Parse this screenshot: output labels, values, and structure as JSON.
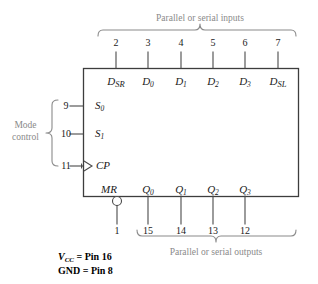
{
  "diagram": {
    "chip": {
      "x": 83,
      "y": 68,
      "width": 215,
      "height": 128,
      "stroke": "#3d3d3d"
    },
    "colors": {
      "line": "#4a4a4a",
      "text": "#1a1a1a",
      "caption_gray": "#8a8a8a",
      "background": "#ffffff"
    }
  },
  "top": {
    "caption": "Parallel or serial inputs",
    "caption_x": 200,
    "caption_y": 14,
    "brace": {
      "x1": 98,
      "x2": 296,
      "y": 30,
      "mid": 200
    },
    "pins": [
      {
        "number": "2",
        "x": 116,
        "label_main": "D",
        "label_sub": "SR",
        "sub_kind": "smallcap"
      },
      {
        "number": "3",
        "x": 148,
        "label_main": "D",
        "label_sub": "0",
        "sub_kind": "sub"
      },
      {
        "number": "4",
        "x": 181,
        "label_main": "D",
        "label_sub": "1",
        "sub_kind": "sub"
      },
      {
        "number": "5",
        "x": 213,
        "label_main": "D",
        "label_sub": "2",
        "sub_kind": "sub"
      },
      {
        "number": "6",
        "x": 245,
        "label_main": "D",
        "label_sub": "3",
        "sub_kind": "sub"
      },
      {
        "number": "7",
        "x": 278,
        "label_main": "D",
        "label_sub": "SL",
        "sub_kind": "smallcap"
      }
    ],
    "pinnum_y": 38,
    "stub_top": 52,
    "label_y": 76
  },
  "left": {
    "caption_line1": "Mode",
    "caption_line2": "control",
    "caption_x": 12,
    "caption_y": 120,
    "brace": {
      "x": 52,
      "y1": 100,
      "y2": 166,
      "mid": 133
    },
    "pins": [
      {
        "number": "9",
        "y": 106,
        "label_main": "S",
        "label_sub": "0",
        "sub_kind": "sub",
        "arrow": false
      },
      {
        "number": "10",
        "y": 134,
        "label_main": "S",
        "label_sub": "1",
        "sub_kind": "sub",
        "arrow": false
      },
      {
        "number": "11",
        "y": 166,
        "label_main": "CP",
        "label_sub": "",
        "sub_kind": "none",
        "arrow": true
      }
    ],
    "pinnum_x": 66,
    "lead_start_x": 70,
    "label_x": 95
  },
  "bottom": {
    "caption": "Parallel or serial outputs",
    "caption_x": 216,
    "caption_y": 248,
    "brace": {
      "x1": 137,
      "x2": 296,
      "y": 236,
      "mid": 216
    },
    "mr": {
      "label": "MR",
      "label_x": 101,
      "label_y": 184,
      "bubble_x": 117,
      "bubble_y": 201,
      "bubble_r": 4.5,
      "pin_number": "1",
      "pin_x": 117
    },
    "pins": [
      {
        "number": "15",
        "x": 148,
        "label_main": "Q",
        "label_sub": "0",
        "sub_kind": "sub"
      },
      {
        "number": "14",
        "x": 181,
        "label_main": "Q",
        "label_sub": "1",
        "sub_kind": "sub"
      },
      {
        "number": "13",
        "x": 213,
        "label_main": "Q",
        "label_sub": "2",
        "sub_kind": "sub"
      },
      {
        "number": "12",
        "x": 245,
        "label_main": "Q",
        "label_sub": "3",
        "sub_kind": "sub"
      }
    ],
    "label_y": 184,
    "stub_bottom": 224,
    "pinnum_y": 226
  },
  "footnotes": [
    {
      "text_html": "<i>V<sub>CC</sub></i> = Pin 16",
      "x": 58,
      "y": 252
    },
    {
      "text_html": "GND = Pin 8",
      "x": 58,
      "y": 266
    }
  ],
  "footnote_values": {
    "vcc_label": "VCC",
    "vcc_pin": "Pin 16",
    "gnd_label": "GND",
    "gnd_pin": "Pin 8"
  }
}
